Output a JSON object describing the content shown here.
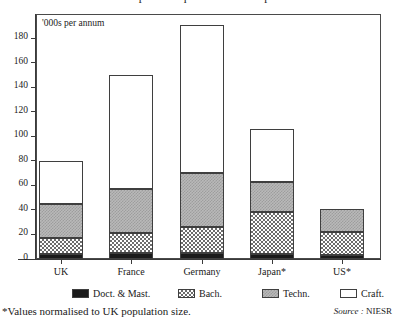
{
  "title_cut": "Comparative qualifications output",
  "axis_note": "'000s per annum",
  "footnote": "*Values normalised to UK population size.",
  "source_label": "Source :",
  "source_value": "NIESR",
  "colors": {
    "doct": "#1b1b1b",
    "bach": "#6d6d6d",
    "techn": "#b9b9b9",
    "craft": "#ffffff",
    "axis": "#3a3a3a"
  },
  "chart_data": {
    "type": "bar",
    "title": "",
    "subtitle": "'000s per annum",
    "stacked": true,
    "xlabel": "",
    "ylabel": "'000s per annum",
    "ylim": [
      0,
      190
    ],
    "yticks": [
      0,
      20,
      40,
      60,
      80,
      100,
      120,
      140,
      160,
      180
    ],
    "grid": false,
    "legend_position": "bottom",
    "categories": [
      "UK",
      "France",
      "Germany",
      "Japan*",
      "US*"
    ],
    "series": [
      {
        "name": "Doct. & Mast.",
        "values": [
          4,
          5,
          5,
          4,
          3
        ]
      },
      {
        "name": "Bach.",
        "values": [
          13,
          16,
          21,
          34,
          19
        ]
      },
      {
        "name": "Techn.",
        "values": [
          28,
          36,
          44,
          25,
          19
        ]
      },
      {
        "name": "Craft.",
        "values": [
          35,
          93,
          121,
          43,
          0
        ]
      }
    ],
    "totals": [
      80,
      150,
      191,
      106,
      41
    ],
    "annotations": [
      "*Values normalised to UK population size.",
      "Source : NIESR"
    ]
  },
  "legend": {
    "items": [
      {
        "label": "Doct. & Mast.",
        "swatch": "solid-black"
      },
      {
        "label": "Bach.",
        "swatch": "fine-checker"
      },
      {
        "label": "Techn.",
        "swatch": "grey-checker"
      },
      {
        "label": "Craft.",
        "swatch": "white"
      }
    ]
  }
}
